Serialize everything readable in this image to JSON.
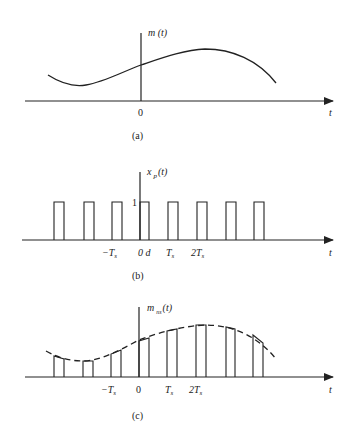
{
  "panels": [
    {
      "id": "a",
      "caption": "(a)",
      "y_label": "m (t)",
      "x_label": "t",
      "origin_label": "0",
      "curve": "m(t) smooth message signal"
    },
    {
      "id": "b",
      "caption": "(b)",
      "y_label_main": "x",
      "y_label_sub": "p",
      "y_label_tail": "(t)",
      "x_label": "t",
      "amplitude_label": "1",
      "tick_labels": {
        "neg_ts": "−T",
        "neg_ts_sub": "s",
        "zero_d": "0 d",
        "ts": "T",
        "ts_sub": "s",
        "two_ts": "2T",
        "two_ts_sub": "s"
      },
      "pulse_count": 8
    },
    {
      "id": "c",
      "caption": "(c)",
      "y_label_main": "m",
      "y_label_sub": "ns",
      "y_label_tail": "(t)",
      "x_label": "t",
      "tick_labels": {
        "neg_ts": "−T",
        "neg_ts_sub": "s",
        "zero": "0",
        "ts": "T",
        "ts_sub": "s",
        "two_ts": "2T",
        "two_ts_sub": "s"
      },
      "pulse_count": 8
    }
  ],
  "colors": {
    "stroke": "#222222",
    "background": "#ffffff"
  }
}
